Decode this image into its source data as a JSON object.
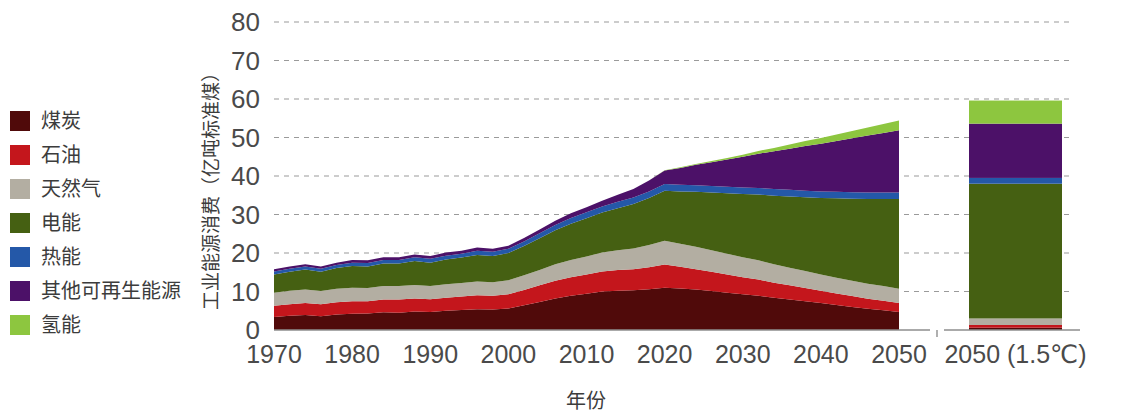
{
  "legend": {
    "items": [
      {
        "label": "煤炭",
        "color": "#500a0a",
        "key": "coal"
      },
      {
        "label": "石油",
        "color": "#c4161c",
        "key": "oil"
      },
      {
        "label": "天然气",
        "color": "#b3aea2",
        "key": "gas"
      },
      {
        "label": "电能",
        "color": "#456012",
        "key": "electricity"
      },
      {
        "label": "热能",
        "color": "#2458a8",
        "key": "heat"
      },
      {
        "label": "其他可再生能源",
        "color": "#4c1168",
        "key": "other_renewables"
      },
      {
        "label": "氢能",
        "color": "#8dc63f",
        "key": "hydrogen"
      }
    ]
  },
  "chart_data": {
    "type": "area",
    "stacked": true,
    "title": "",
    "xlabel": "年份",
    "ylabel": "工业能源消费（亿吨标准煤）",
    "ylim": [
      0,
      80
    ],
    "ytick_step": 10,
    "yticks": [
      "0",
      "10",
      "20",
      "30",
      "40",
      "50",
      "60",
      "70",
      "80"
    ],
    "xlim": [
      1970,
      2050
    ],
    "xticks": [
      "1970",
      "1980",
      "1990",
      "2000",
      "2010",
      "2020",
      "2030",
      "2040",
      "2050"
    ],
    "grid": true,
    "legend_position": "left-outside",
    "x": [
      1970,
      1972,
      1974,
      1976,
      1978,
      1980,
      1982,
      1984,
      1986,
      1988,
      1990,
      1992,
      1994,
      1996,
      1998,
      2000,
      2002,
      2004,
      2006,
      2008,
      2010,
      2012,
      2014,
      2016,
      2018,
      2020,
      2022,
      2024,
      2026,
      2028,
      2030,
      2032,
      2034,
      2036,
      2038,
      2040,
      2042,
      2044,
      2046,
      2048,
      2050
    ],
    "series": [
      {
        "name": "煤炭",
        "color": "#500a0a",
        "values": [
          3.4,
          3.7,
          3.9,
          3.6,
          4.0,
          4.2,
          4.3,
          4.6,
          4.5,
          4.8,
          4.7,
          5.0,
          5.2,
          5.4,
          5.3,
          5.6,
          6.4,
          7.3,
          8.2,
          8.9,
          9.4,
          10.0,
          10.2,
          10.3,
          10.6,
          11.0,
          10.8,
          10.5,
          10.1,
          9.7,
          9.3,
          8.9,
          8.4,
          7.9,
          7.5,
          7.0,
          6.5,
          6.0,
          5.5,
          5.1,
          4.7
        ]
      },
      {
        "name": "石油",
        "color": "#c4161c",
        "values": [
          2.9,
          3.0,
          3.1,
          3.1,
          3.2,
          3.3,
          3.2,
          3.3,
          3.4,
          3.4,
          3.3,
          3.4,
          3.5,
          3.6,
          3.6,
          3.7,
          4.0,
          4.3,
          4.6,
          4.8,
          5.0,
          5.2,
          5.4,
          5.5,
          5.7,
          6.0,
          5.6,
          5.3,
          5.0,
          4.7,
          4.4,
          4.2,
          3.9,
          3.7,
          3.4,
          3.2,
          3.0,
          2.8,
          2.6,
          2.5,
          2.3
        ]
      },
      {
        "name": "天然气",
        "color": "#b3aea2",
        "values": [
          3.4,
          3.5,
          3.5,
          3.4,
          3.5,
          3.5,
          3.4,
          3.5,
          3.5,
          3.5,
          3.4,
          3.5,
          3.5,
          3.6,
          3.5,
          3.6,
          3.8,
          4.0,
          4.3,
          4.5,
          4.7,
          4.9,
          5.1,
          5.4,
          5.8,
          6.2,
          6.0,
          5.8,
          5.6,
          5.4,
          5.2,
          5.0,
          4.8,
          4.6,
          4.4,
          4.2,
          4.1,
          4.0,
          3.9,
          3.8,
          3.7
        ]
      },
      {
        "name": "电能",
        "color": "#456012",
        "values": [
          4.7,
          4.9,
          5.2,
          5.0,
          5.4,
          5.6,
          5.6,
          5.9,
          5.9,
          6.2,
          6.1,
          6.4,
          6.6,
          6.9,
          6.8,
          7.1,
          7.6,
          8.2,
          8.8,
          9.4,
          9.9,
          10.4,
          10.9,
          11.5,
          12.2,
          13.0,
          13.6,
          14.3,
          15.0,
          15.7,
          16.4,
          17.1,
          17.8,
          18.5,
          19.2,
          19.9,
          20.6,
          21.3,
          22.0,
          22.6,
          23.3
        ]
      },
      {
        "name": "热能",
        "color": "#2458a8",
        "values": [
          0.8,
          0.8,
          0.8,
          0.8,
          0.8,
          0.9,
          0.9,
          0.9,
          0.9,
          1.0,
          1.0,
          1.0,
          1.0,
          1.1,
          1.1,
          1.1,
          1.2,
          1.3,
          1.4,
          1.5,
          1.6,
          1.6,
          1.7,
          1.7,
          1.7,
          1.7,
          1.7,
          1.7,
          1.7,
          1.7,
          1.7,
          1.7,
          1.7,
          1.7,
          1.7,
          1.7,
          1.7,
          1.7,
          1.7,
          1.7,
          1.7
        ]
      },
      {
        "name": "其他可再生能源",
        "color": "#4c1168",
        "values": [
          0.6,
          0.6,
          0.6,
          0.6,
          0.6,
          0.7,
          0.7,
          0.7,
          0.7,
          0.7,
          0.7,
          0.8,
          0.8,
          0.8,
          0.8,
          0.8,
          0.9,
          1.0,
          1.1,
          1.2,
          1.3,
          1.5,
          1.8,
          2.2,
          2.8,
          3.5,
          4.4,
          5.3,
          6.2,
          7.1,
          8.0,
          8.9,
          9.8,
          10.7,
          11.6,
          12.4,
          13.2,
          14.0,
          14.8,
          15.5,
          16.2
        ]
      },
      {
        "name": "氢能",
        "color": "#8dc63f",
        "values": [
          0,
          0,
          0,
          0,
          0,
          0,
          0,
          0,
          0,
          0,
          0,
          0,
          0,
          0,
          0,
          0,
          0,
          0,
          0,
          0,
          0,
          0,
          0,
          0,
          0.05,
          0.1,
          0.15,
          0.2,
          0.3,
          0.4,
          0.5,
          0.7,
          0.9,
          1.1,
          1.3,
          1.5,
          1.7,
          1.9,
          2.1,
          2.3,
          2.5
        ]
      }
    ],
    "scenario_bar": {
      "label": "2050 (1.5℃)",
      "total": 59.6,
      "segments": [
        {
          "name": "煤炭",
          "color": "#500a0a",
          "value": 0.6
        },
        {
          "name": "石油",
          "color": "#c4161c",
          "value": 0.7
        },
        {
          "name": "天然气",
          "color": "#b3aea2",
          "value": 1.7
        },
        {
          "name": "电能",
          "color": "#456012",
          "value": 35.0
        },
        {
          "name": "热能",
          "color": "#2458a8",
          "value": 1.5
        },
        {
          "name": "其他可再生能源",
          "color": "#4c1168",
          "value": 14.1
        },
        {
          "name": "氢能",
          "color": "#8dc63f",
          "value": 6.0
        }
      ]
    }
  }
}
